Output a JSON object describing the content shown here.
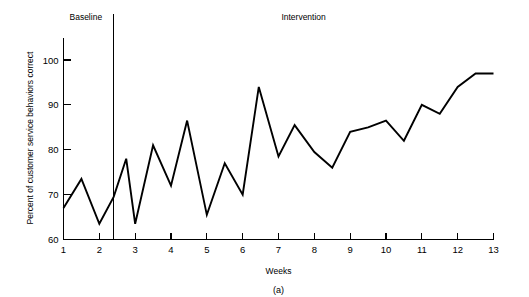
{
  "chart_data": {
    "type": "line",
    "title": "",
    "subtitle": "",
    "xlabel": "Weeks",
    "ylabel": "Percent of customer service behaviors correct",
    "caption": "(a)",
    "xlim": [
      1,
      13
    ],
    "ylim": [
      60,
      105
    ],
    "y_axis_top_value": 105,
    "grid": false,
    "legend": "none",
    "y_ticks": [
      60,
      70,
      80,
      90,
      100
    ],
    "y_tick_labels": [
      "60",
      "70",
      "80",
      "90",
      "100"
    ],
    "x_ticks": [
      1,
      2,
      3,
      4,
      5,
      6,
      7,
      8,
      9,
      10,
      11,
      12,
      13
    ],
    "x_tick_labels": [
      "1",
      "2",
      "3",
      "4",
      "5",
      "6",
      "7",
      "8",
      "9",
      "10",
      "11",
      "12",
      "13"
    ],
    "phase_label_baseline": "Baseline",
    "phase_label_intervention": "Intervention",
    "phase_change_x": 2.4,
    "series": [
      {
        "name": "Percent of customer service behaviors correct",
        "color": "#000000",
        "x": [
          1.0,
          1.5,
          2.0,
          2.4,
          2.75,
          3.0,
          3.5,
          4.0,
          4.45,
          5.0,
          5.5,
          6.0,
          6.45,
          7.0,
          7.45,
          8.0,
          8.5,
          9.0,
          9.5,
          10.0,
          10.5,
          11.0,
          11.5,
          12.0,
          12.5,
          13.0
        ],
        "y": [
          67,
          73.5,
          63.5,
          69.5,
          78,
          63.5,
          81,
          72,
          86.5,
          65.5,
          77,
          70,
          94,
          78.5,
          85.5,
          79.5,
          76,
          84,
          85,
          86.5,
          82,
          90,
          88,
          94,
          97,
          97
        ]
      }
    ]
  },
  "figure": {
    "baseline_label": "Baseline",
    "intervention_label": "Intervention",
    "x_axis_title": "Weeks",
    "y_axis_title": "Percent of customer service behaviors correct",
    "caption_label": "(a)"
  }
}
